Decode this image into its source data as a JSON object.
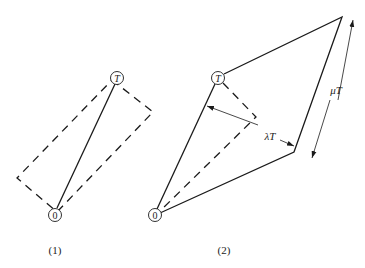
{
  "figure1": {
    "caption": "(1)",
    "origin_label": "0",
    "target_label": "T"
  },
  "figure2": {
    "caption": "(2)",
    "origin_label": "0",
    "target_label": "T",
    "width_label": "λT",
    "length_label": "μT"
  },
  "colors": {
    "stroke": "#1a1a1a",
    "background": "#ffffff"
  }
}
